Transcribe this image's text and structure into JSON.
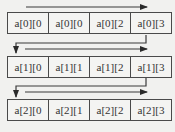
{
  "diagram": {
    "title": "",
    "rows": [
      {
        "cells": [
          "a[0][0",
          "a[0][0",
          "a[0][2",
          "a[0][3"
        ]
      },
      {
        "cells": [
          "a[1][0",
          "a[1][1",
          "a[1][2",
          "a[1][3"
        ]
      },
      {
        "cells": [
          "a[2][0",
          "a[2][1",
          "a[2][2",
          "a[2][3"
        ]
      }
    ],
    "colors": {
      "line": "#3a3a3a",
      "cell_border": "#4a4a4a",
      "background": "#f1f1ef"
    }
  }
}
